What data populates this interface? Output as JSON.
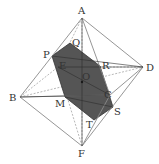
{
  "diagram": {
    "colors": {
      "edge": "#8a8a8a",
      "hidden_edge": "#9a9a9a",
      "section_fill": "#555555",
      "section_stroke": "#333333",
      "label": "#333333"
    },
    "points": {
      "A": {
        "label": "A",
        "x": 82,
        "y": 18,
        "lx": 78,
        "ly": 14
      },
      "B": {
        "label": "B",
        "x": 20,
        "y": 97,
        "lx": 9,
        "ly": 101
      },
      "C": {
        "label": "C",
        "x": 110,
        "y": 95,
        "lx": 104,
        "ly": 98
      },
      "D": {
        "label": "D",
        "x": 143,
        "y": 67,
        "lx": 146,
        "ly": 71
      },
      "E": {
        "label": "E",
        "x": 58,
        "y": 67,
        "lx": 59,
        "ly": 69
      },
      "F": {
        "label": "F",
        "x": 82,
        "y": 146,
        "lx": 78,
        "ly": 157
      },
      "O": {
        "label": "O",
        "x": 82,
        "y": 82,
        "lx": 82,
        "ly": 80
      },
      "P": {
        "label": "P",
        "x": 52,
        "y": 56,
        "lx": 43,
        "ly": 58
      },
      "Q": {
        "label": "Q",
        "x": 70,
        "y": 43,
        "lx": 72,
        "ly": 46
      },
      "R": {
        "label": "R",
        "x": 100,
        "y": 66,
        "lx": 102,
        "ly": 69
      },
      "S": {
        "label": "S",
        "x": 113,
        "y": 107,
        "lx": 114,
        "ly": 115
      },
      "T": {
        "label": "T",
        "x": 94,
        "y": 120,
        "lx": 86,
        "ly": 128
      },
      "M": {
        "label": "M",
        "x": 65,
        "y": 97,
        "lx": 55,
        "ly": 107
      }
    },
    "section_polygon": [
      "P",
      "Q",
      "R",
      "S",
      "T",
      "M"
    ],
    "visible_edges": [
      [
        "A",
        "B"
      ],
      [
        "A",
        "C"
      ],
      [
        "A",
        "D"
      ],
      [
        "B",
        "C"
      ],
      [
        "C",
        "D"
      ],
      [
        "B",
        "F"
      ],
      [
        "C",
        "F"
      ],
      [
        "D",
        "F"
      ]
    ],
    "hidden_edges": [
      [
        "A",
        "E"
      ],
      [
        "B",
        "E"
      ],
      [
        "D",
        "E"
      ],
      [
        "E",
        "F"
      ],
      [
        "A",
        "F"
      ],
      [
        "B",
        "D"
      ],
      [
        "E",
        "C"
      ]
    ]
  }
}
